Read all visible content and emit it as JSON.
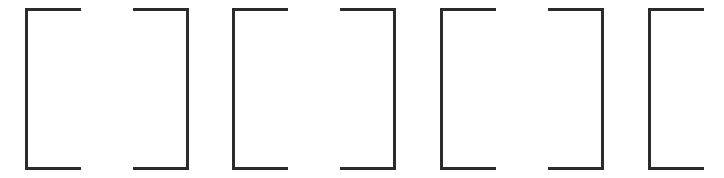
{
  "canvas": {
    "width": 724,
    "height": 178,
    "background_color": "#ffffff",
    "ink_color": "#2b2b2b",
    "stroke_width_px": 3
  },
  "content": {
    "description": "Row of seven printed square brackets alternating open and close",
    "text": "[ ] [ ] [ ] [",
    "glyph_count": 7
  },
  "glyphs": [
    {
      "index": 1,
      "char": "[",
      "kind": "left-bracket",
      "x": 25,
      "y": 8,
      "width": 56,
      "height": 162,
      "clipped": false
    },
    {
      "index": 2,
      "char": "]",
      "kind": "right-bracket",
      "x": 133,
      "y": 8,
      "width": 56,
      "height": 162,
      "clipped": false
    },
    {
      "index": 3,
      "char": "[",
      "kind": "left-bracket",
      "x": 232,
      "y": 8,
      "width": 56,
      "height": 162,
      "clipped": false
    },
    {
      "index": 4,
      "char": "]",
      "kind": "right-bracket",
      "x": 340,
      "y": 8,
      "width": 56,
      "height": 162,
      "clipped": false
    },
    {
      "index": 5,
      "char": "[",
      "kind": "left-bracket",
      "x": 440,
      "y": 8,
      "width": 56,
      "height": 162,
      "clipped": false
    },
    {
      "index": 6,
      "char": "]",
      "kind": "right-bracket",
      "x": 548,
      "y": 8,
      "width": 56,
      "height": 162,
      "clipped": false
    },
    {
      "index": 7,
      "char": "[",
      "kind": "left-bracket",
      "x": 648,
      "y": 8,
      "width": 56,
      "height": 162,
      "clipped": true
    }
  ]
}
